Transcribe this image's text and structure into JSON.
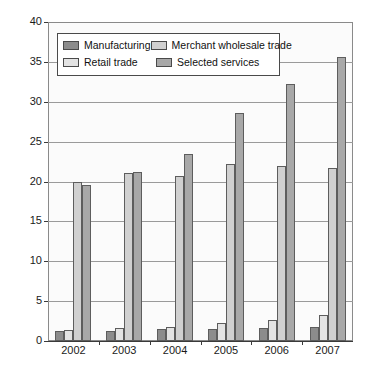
{
  "chart_data": {
    "type": "bar",
    "title": "",
    "subtitle": "",
    "xlabel": "",
    "ylabel": "",
    "categories": [
      "2002",
      "2003",
      "2004",
      "2005",
      "2006",
      "2007"
    ],
    "ylim": [
      0,
      40
    ],
    "yticks": [
      0,
      5,
      10,
      15,
      20,
      25,
      30,
      35,
      40
    ],
    "ytick_labels": [
      "0",
      "5",
      "10",
      "15",
      "20",
      "25",
      "30",
      "35",
      "40"
    ],
    "grid": true,
    "legend_position": "top-left-inside",
    "series": [
      {
        "name": "Manufacturing",
        "color": "#8c8c8c",
        "values": [
          1.2,
          1.3,
          1.5,
          1.5,
          1.6,
          1.8
        ]
      },
      {
        "name": "Retail trade",
        "color": "#e3e3e3",
        "values": [
          1.4,
          1.6,
          1.8,
          2.2,
          2.6,
          3.2
        ]
      },
      {
        "name": "Merchant wholesale trade",
        "color": "#d0d0d0",
        "values": [
          19.9,
          21.1,
          20.7,
          22.2,
          22.0,
          21.7
        ]
      },
      {
        "name": "Selected services",
        "color": "#a8a8a8",
        "values": [
          19.6,
          21.2,
          23.5,
          28.6,
          32.2,
          35.6
        ]
      }
    ]
  },
  "legend": {
    "entries": [
      {
        "label": "Manufacturing",
        "color": "#8c8c8c"
      },
      {
        "label": "Merchant wholesale trade",
        "color": "#d0d0d0"
      },
      {
        "label": "Retail trade",
        "color": "#e3e3e3"
      },
      {
        "label": "Selected services",
        "color": "#a8a8a8"
      }
    ]
  }
}
